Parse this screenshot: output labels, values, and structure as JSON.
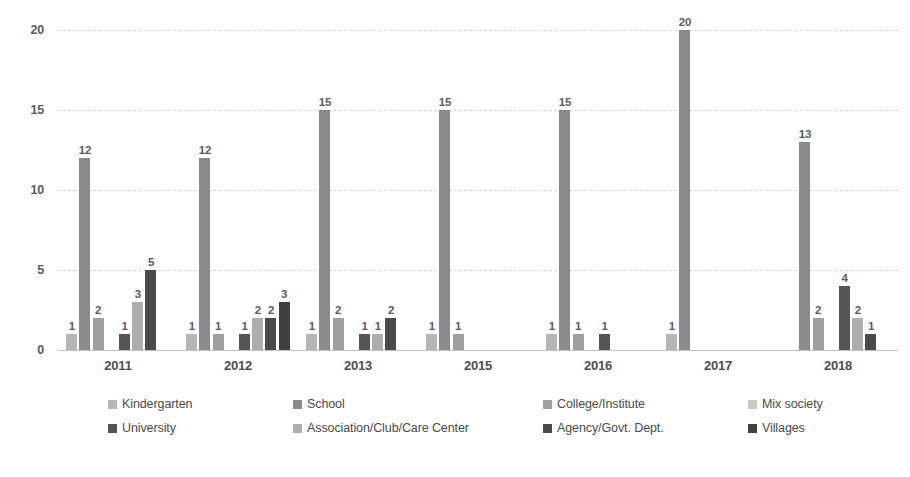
{
  "chart_data": {
    "type": "bar",
    "title": "",
    "subtitle": "",
    "xlabel": "",
    "ylabel": "",
    "ylim": [
      0,
      20
    ],
    "ytick_labels": [
      "0",
      "5",
      "10",
      "15",
      "20"
    ],
    "yticks": [
      0,
      5,
      10,
      15,
      20
    ],
    "grid": true,
    "legend_position": "bottom",
    "categories": [
      "2011",
      "2012",
      "2013",
      "2015",
      "2016",
      "2017",
      "2018"
    ],
    "series": [
      {
        "name": "Kindergarten",
        "color": "#b6b6b6",
        "values": [
          1,
          1,
          1,
          1,
          1,
          1,
          null
        ]
      },
      {
        "name": "School",
        "color": "#8a8a8a",
        "values": [
          12,
          12,
          15,
          15,
          15,
          20,
          13
        ]
      },
      {
        "name": "College/Institute",
        "color": "#a0a0a0",
        "values": [
          2,
          1,
          2,
          1,
          1,
          null,
          2
        ]
      },
      {
        "name": "Mix society",
        "color": "#c9c9c9",
        "values": [
          null,
          null,
          null,
          null,
          null,
          null,
          null
        ]
      },
      {
        "name": "University",
        "color": "#555555",
        "values": [
          1,
          1,
          1,
          null,
          1,
          null,
          4
        ]
      },
      {
        "name": "Association/Club/Care Center",
        "color": "#aeaeae",
        "values": [
          3,
          2,
          1,
          null,
          null,
          null,
          2
        ]
      },
      {
        "name": "Agency/Govt. Dept.",
        "color": "#4a4a4a",
        "values": [
          5,
          2,
          2,
          null,
          null,
          null,
          1
        ]
      },
      {
        "name": "Villages",
        "color": "#3f3f3f",
        "values": [
          null,
          3,
          null,
          null,
          null,
          null,
          null
        ]
      }
    ]
  },
  "legend": {
    "items": [
      {
        "label": "Kindergarten",
        "color": "#b6b6b6"
      },
      {
        "label": "School",
        "color": "#8a8a8a"
      },
      {
        "label": "College/Institute",
        "color": "#a0a0a0"
      },
      {
        "label": "Mix society",
        "color": "#c9c9c9"
      },
      {
        "label": "University",
        "color": "#555555"
      },
      {
        "label": "Association/Club/Care Center",
        "color": "#aeaeae"
      },
      {
        "label": "Agency/Govt. Dept.",
        "color": "#4a4a4a"
      },
      {
        "label": "Villages",
        "color": "#3f3f3f"
      }
    ]
  }
}
